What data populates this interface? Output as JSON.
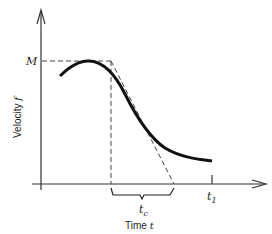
{
  "diagram": {
    "y_axis_label": "Velocity ",
    "y_axis_var": "f",
    "x_axis_label": "Time ",
    "x_axis_var": "t",
    "max_label": "M",
    "t1_label": "t",
    "t1_sub": "1",
    "tc_label": "t",
    "tc_sub": "c",
    "colors": {
      "curve": "#111111",
      "axis": "#333333",
      "dashed": "#444444"
    }
  }
}
